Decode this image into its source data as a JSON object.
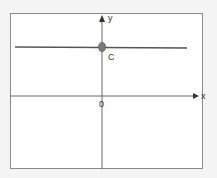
{
  "diagram": {
    "type": "coordinate-graph",
    "axes": {
      "x_label": "x",
      "y_label": "y",
      "origin_label": "0"
    },
    "line": {
      "equation": "y = C",
      "kind": "horizontal"
    },
    "point": {
      "label": "C",
      "location": "y-intercept"
    },
    "colors": {
      "background": "#f4f4f4",
      "frame_fill": "#ffffff",
      "frame_border": "#8a8a8a",
      "axis": "#666666",
      "line": "#555555",
      "point_fill": "#7a7a7a",
      "text": "#333333"
    }
  }
}
